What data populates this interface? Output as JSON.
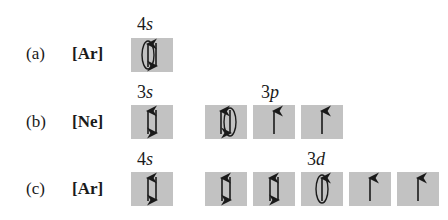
{
  "colors": {
    "box_fill": "#c2c2c2",
    "ink": "#1a1a1a",
    "background": "#ffffff"
  },
  "rows": [
    {
      "id": "a",
      "label": "(a)",
      "core": "[Ar]",
      "groups": [
        {
          "shell": "4",
          "sub": "s",
          "orbitals": [
            {
              "spins": [
                "up",
                "down"
              ],
              "circled": "up"
            }
          ]
        }
      ]
    },
    {
      "id": "b",
      "label": "(b)",
      "core": "[Ne]",
      "groups": [
        {
          "shell": "3",
          "sub": "s",
          "orbitals": [
            {
              "spins": [
                "up",
                "down"
              ],
              "circled": null
            }
          ]
        },
        {
          "shell": "3",
          "sub": "p",
          "orbitals": [
            {
              "spins": [
                "up",
                "down"
              ],
              "circled": "down"
            },
            {
              "spins": [
                "up"
              ],
              "circled": null
            },
            {
              "spins": [
                "up"
              ],
              "circled": null
            }
          ]
        }
      ]
    },
    {
      "id": "c",
      "label": "(c)",
      "core": "[Ar]",
      "groups": [
        {
          "shell": "4",
          "sub": "s",
          "orbitals": [
            {
              "spins": [
                "up",
                "down"
              ],
              "circled": null
            }
          ]
        },
        {
          "shell": "3",
          "sub": "d",
          "orbitals": [
            {
              "spins": [
                "up",
                "down"
              ],
              "circled": null
            },
            {
              "spins": [
                "up",
                "down"
              ],
              "circled": null
            },
            {
              "spins": [
                "up"
              ],
              "circled": "up"
            },
            {
              "spins": [
                "up"
              ],
              "circled": null
            },
            {
              "spins": [
                "up"
              ],
              "circled": null
            }
          ]
        }
      ]
    }
  ]
}
